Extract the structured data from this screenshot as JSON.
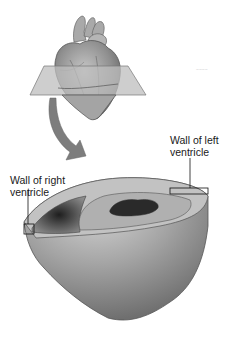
{
  "diagram": {
    "labels": {
      "left_wall": {
        "line1": "Wall of left",
        "line2": "ventricle"
      },
      "right_wall": {
        "line1": "Wall of right",
        "line2": "ventricle"
      }
    },
    "faint_text": "~~~~",
    "colors": {
      "heart": "#9a9a9a",
      "plane": "#bdbdbd",
      "arrow": "#7a7a7a",
      "section_outer": "#a8a8a8",
      "section_top": "#c4c4c4",
      "cavity": "#3a3a3a",
      "outline": "#555555"
    }
  }
}
